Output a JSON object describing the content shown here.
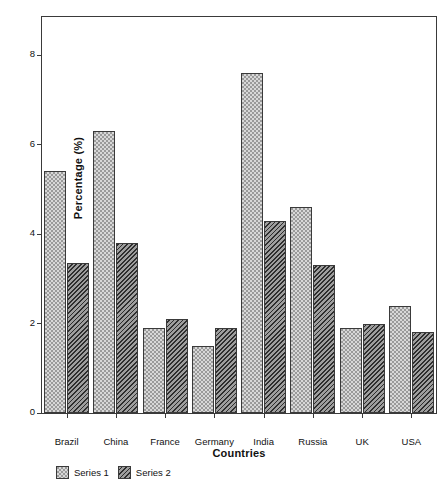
{
  "chart_data": {
    "type": "bar",
    "title": "",
    "subtitle": "",
    "xlabel": "Countries",
    "ylabel": "Percentage (%)",
    "categories": [
      "Brazil",
      "China",
      "France",
      "Germany",
      "India",
      "Russia",
      "UK",
      "USA"
    ],
    "series": [
      {
        "name": "Series 1",
        "pattern": "light-dotted",
        "color": "#d8d8d8",
        "values": [
          5.4,
          6.3,
          1.9,
          1.5,
          7.6,
          4.6,
          1.9,
          2.4
        ]
      },
      {
        "name": "Series 2",
        "pattern": "dark-hatched",
        "color": "#4f4f4f",
        "values": [
          3.35,
          3.8,
          2.1,
          1.9,
          4.3,
          3.3,
          2.0,
          1.8
        ]
      }
    ],
    "ylim": [
      0,
      8.85
    ],
    "yticks": [
      0,
      2,
      4,
      6,
      8
    ],
    "ytick_labels": [
      "0",
      "2",
      "4",
      "6",
      "8"
    ],
    "grid": false,
    "legend_position": "bottom-left",
    "axis_color": "#3a3a3a",
    "background": "#ffffff"
  }
}
